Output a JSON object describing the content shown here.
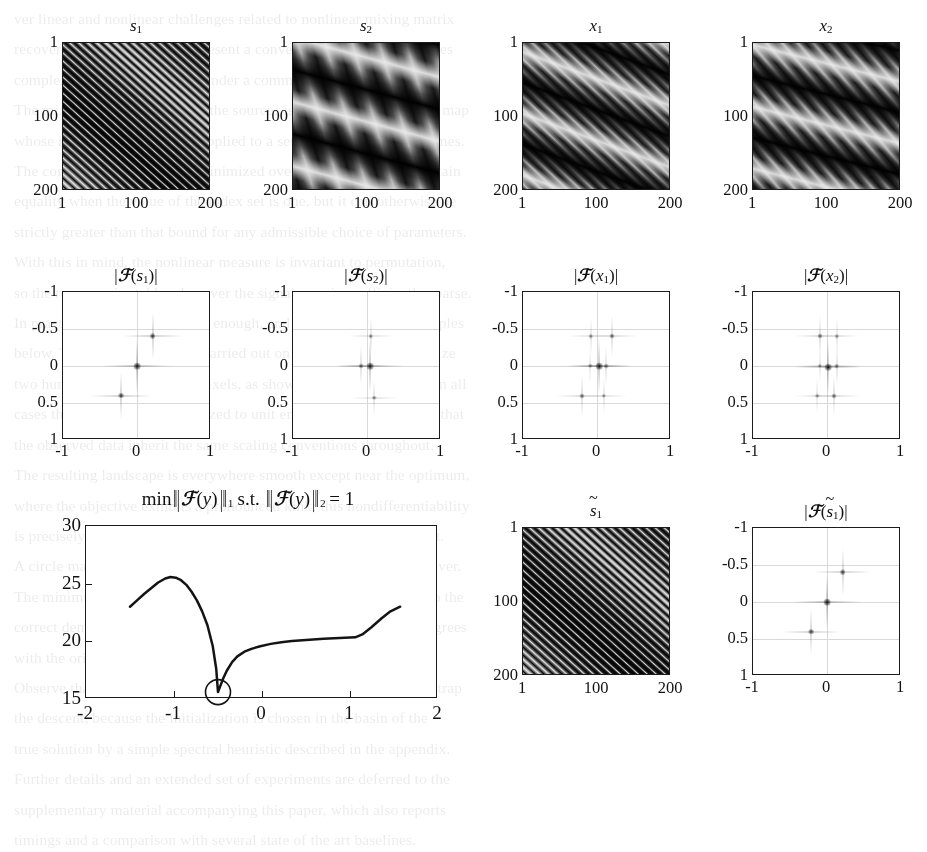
{
  "figure": {
    "width": 927,
    "height": 751,
    "ink": "#1b1b1b",
    "grid_color": "#d9d9d9"
  },
  "image_panels": {
    "axis_ticks_x": [
      "1",
      "100",
      "200"
    ],
    "axis_ticks_y": [
      "1",
      "100",
      "200"
    ],
    "panels": [
      {
        "id": "s1",
        "title_base": "s",
        "title_sub": "1",
        "title_bars": false,
        "title_tilde": false,
        "description": "source 1: high-frequency diagonal sinusoid",
        "angle_deg": 42,
        "period_px": 6,
        "envelope_angle_deg": 38,
        "envelope_period_px": 150,
        "contrast": 1.0
      },
      {
        "id": "s2",
        "title_base": "s",
        "title_sub": "2",
        "title_bars": false,
        "title_tilde": false,
        "description": "source 2: low-frequency broad banded sinusoid",
        "angle_deg": 15,
        "period_px": 62,
        "envelope_angle_deg": 74,
        "envelope_period_px": 26,
        "contrast": 1.0
      },
      {
        "id": "x1",
        "title_base": "x",
        "title_sub": "1",
        "title_bars": false,
        "title_tilde": false,
        "description": "mixture 1 of s1 and s2",
        "angle_deg": 20,
        "period_px": 58,
        "envelope_angle_deg": 44,
        "envelope_period_px": 9,
        "contrast": 0.95
      },
      {
        "id": "x2",
        "title_base": "x",
        "title_sub": "2",
        "title_bars": false,
        "title_tilde": false,
        "description": "mixture 2 of s1 and s2",
        "angle_deg": 14,
        "period_px": 60,
        "envelope_angle_deg": 50,
        "envelope_period_px": 12,
        "contrast": 0.95
      },
      {
        "id": "s1tilde",
        "title_base": "s",
        "title_sub": "1",
        "title_bars": false,
        "title_tilde": true,
        "description": "recovered source 1",
        "angle_deg": 42,
        "period_px": 6,
        "envelope_angle_deg": 38,
        "envelope_period_px": 150,
        "contrast": 1.0
      }
    ]
  },
  "fourier_panels": {
    "axis_ticks_x": [
      "-1",
      "0",
      "1"
    ],
    "axis_ticks_y": [
      "-1",
      "-0.5",
      "0",
      "0.5",
      "1"
    ],
    "xlim": [
      -1,
      1
    ],
    "ylim": [
      -1,
      1
    ],
    "grid_lines_x": [
      0
    ],
    "grid_lines_y": [
      -0.5,
      0,
      0.5
    ],
    "panels": [
      {
        "id": "F_s1",
        "title_base": "s",
        "title_sub": "1",
        "title_tilde": false,
        "peaks": [
          {
            "x": 0.0,
            "y": 0.0,
            "strength": 1.0
          },
          {
            "x": 0.21,
            "y": -0.4,
            "strength": 0.82
          },
          {
            "x": -0.21,
            "y": 0.4,
            "strength": 0.82
          }
        ]
      },
      {
        "id": "F_s2",
        "title_base": "s",
        "title_sub": "2",
        "title_tilde": false,
        "peaks": [
          {
            "x": 0.04,
            "y": 0.0,
            "strength": 1.0
          },
          {
            "x": -0.08,
            "y": 0.0,
            "strength": 0.6
          },
          {
            "x": 0.05,
            "y": -0.4,
            "strength": 0.5
          },
          {
            "x": 0.1,
            "y": 0.43,
            "strength": 0.5
          }
        ]
      },
      {
        "id": "F_x1",
        "title_base": "x",
        "title_sub": "1",
        "title_tilde": false,
        "peaks": [
          {
            "x": 0.03,
            "y": 0.0,
            "strength": 1.0
          },
          {
            "x": 0.12,
            "y": 0.0,
            "strength": 0.55
          },
          {
            "x": -0.09,
            "y": 0.0,
            "strength": 0.45
          },
          {
            "x": 0.2,
            "y": -0.4,
            "strength": 0.62
          },
          {
            "x": -0.08,
            "y": -0.4,
            "strength": 0.48
          },
          {
            "x": -0.2,
            "y": 0.4,
            "strength": 0.62
          },
          {
            "x": 0.09,
            "y": 0.4,
            "strength": 0.48
          }
        ]
      },
      {
        "id": "F_x2",
        "title_base": "x",
        "title_sub": "2",
        "title_tilde": false,
        "peaks": [
          {
            "x": 0.02,
            "y": 0.02,
            "strength": 1.0
          },
          {
            "x": 0.13,
            "y": 0.0,
            "strength": 0.55
          },
          {
            "x": -0.1,
            "y": 0.0,
            "strength": 0.45
          },
          {
            "x": -0.1,
            "y": -0.4,
            "strength": 0.6
          },
          {
            "x": 0.13,
            "y": -0.4,
            "strength": 0.45
          },
          {
            "x": 0.1,
            "y": 0.4,
            "strength": 0.6
          },
          {
            "x": -0.13,
            "y": 0.4,
            "strength": 0.45
          }
        ]
      },
      {
        "id": "F_s1tilde",
        "title_base": "s",
        "title_sub": "1",
        "title_tilde": true,
        "peaks": [
          {
            "x": 0.0,
            "y": 0.0,
            "strength": 1.0
          },
          {
            "x": 0.21,
            "y": -0.4,
            "strength": 0.78
          },
          {
            "x": -0.21,
            "y": 0.4,
            "strength": 0.78
          }
        ]
      }
    ]
  },
  "chart_data": {
    "type": "line",
    "title_parts": {
      "min": "min",
      "norm_open": "‖‖",
      "operator": "ℱ",
      "variable": "y",
      "subscript_1": "1",
      "st": "s.t.",
      "subscript_2": "2",
      "equals": "= 1"
    },
    "xlabel": "",
    "ylabel": "",
    "xlim": [
      -2,
      2
    ],
    "ylim": [
      15,
      30
    ],
    "xticks": [
      -2,
      -1,
      0,
      1,
      2
    ],
    "xtick_labels": [
      "-2",
      "-1",
      "0",
      "1",
      "2"
    ],
    "yticks": [
      15,
      20,
      25,
      30
    ],
    "ytick_labels": [
      "15",
      "20",
      "25",
      "30"
    ],
    "grid": false,
    "legend": null,
    "series": [
      {
        "name": "objective",
        "x": [
          -1.5,
          -1.42,
          -1.34,
          -1.26,
          -1.18,
          -1.1,
          -1.04,
          -0.98,
          -0.92,
          -0.86,
          -0.8,
          -0.74,
          -0.68,
          -0.62,
          -0.56,
          -0.52,
          -0.5,
          -0.47,
          -0.44,
          -0.4,
          -0.34,
          -0.28,
          -0.2,
          -0.12,
          -0.02,
          0.1,
          0.22,
          0.34,
          0.46,
          0.58,
          0.7,
          0.82,
          0.94,
          1.06,
          1.14,
          1.24,
          1.36,
          1.46,
          1.57
        ],
        "y": [
          23.0,
          23.55,
          24.1,
          24.6,
          25.1,
          25.45,
          25.58,
          25.52,
          25.3,
          24.9,
          24.3,
          23.55,
          22.6,
          21.4,
          19.6,
          17.6,
          15.6,
          16.2,
          16.8,
          17.45,
          18.2,
          18.7,
          19.1,
          19.35,
          19.58,
          19.78,
          19.92,
          20.02,
          20.1,
          20.16,
          20.22,
          20.26,
          20.3,
          20.35,
          20.6,
          21.2,
          22.0,
          22.6,
          23.0
        ]
      }
    ],
    "markers": [
      {
        "type": "circle-open",
        "x": -0.5,
        "y": 15.6,
        "label": "global minimum"
      }
    ]
  },
  "bleed_text": {
    "lines": [
      "ver linear and nonlinear challenges related to nonlinear mixing matrix",
      "recovery. In this section, we present a convex formulation that unifies",
      "complex separation problems under a common sparsity-based prior.",
      "The mixing operator acting on the sources is assumed to be a linear map",
      "whose inverse is sought; it is applied to a set of observed signal frames.",
      "The corresponding energy is minimized over the sphere, and we obtain",
      "equality when the value of the index set is one, but it can otherwise be",
      "strictly greater than that bound for any admissible choice of parameters.",
      "With this in mind, the nonlinear measure is invariant to permutation,",
      "so the recovery is stable whenever the signal remains sufficiently sparse.",
      "In practice, a few iterations are enough, and we report typical examples",
      "below. The experiments were carried out on synthetic mixtures of size",
      "two hundred by two hundred pixels, as shown in the figure above. In all",
      "cases the sources were normalized to unit energy before mixing, so that",
      "the observed data inherit the same scaling conventions throughout.",
      "The resulting landscape is everywhere smooth except near the optimum,",
      "where the objective exhibits a pronounced kink; this nondifferentiability",
      "is precisely what enforces sparsity of the recovered spectral support.",
      "A circle marks the location of the global minimum found by the solver.",
      "The minimum is located at a point whose coordinates correspond to the",
      "correct demixing direction, and the corresponding reconstruction agrees",
      "with the original source up to a sign and a global scaling constant.",
      "Observe that the spurious local maximum near minus one does not trap",
      "the descent, because the initialization is chosen in the basin of the",
      "true solution by a simple spectral heuristic described in the appendix.",
      "Further details and an extended set of experiments are deferred to the",
      "supplementary material accompanying this paper, which also reports",
      "timings and a comparison with several state of the art baselines."
    ]
  }
}
